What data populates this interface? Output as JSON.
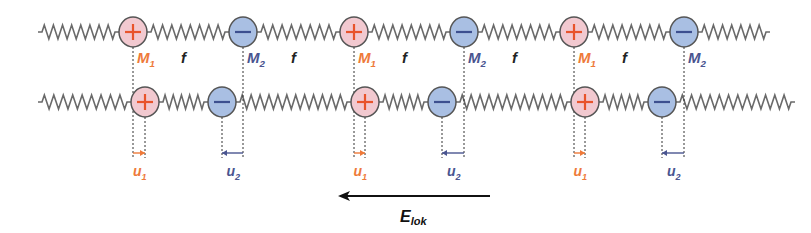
{
  "colors": {
    "positive_fill": "#f2c9d0",
    "negative_fill": "#a9bfe3",
    "positive_sign": "#e8542c",
    "negative_sign": "#3d4f8f",
    "outline": "#555555",
    "spring": "#6a6a6a",
    "label_m1": "#ee7a3a",
    "label_m2": "#4a5590",
    "label_f": "#222222",
    "label_u1": "#ee7a3a",
    "label_u2": "#4a5590",
    "field": "#111111"
  },
  "top_row": {
    "y": 32,
    "ions": [
      {
        "x": 133,
        "charge": "+"
      },
      {
        "x": 243,
        "charge": "-"
      },
      {
        "x": 354,
        "charge": "+"
      },
      {
        "x": 464,
        "charge": "-"
      },
      {
        "x": 574,
        "charge": "+"
      },
      {
        "x": 684,
        "charge": "-"
      }
    ],
    "ends": [
      38,
      770
    ]
  },
  "bottom_row": {
    "y": 102,
    "ions": [
      {
        "x": 145,
        "charge": "+"
      },
      {
        "x": 222,
        "charge": "-"
      },
      {
        "x": 365,
        "charge": "+"
      },
      {
        "x": 442,
        "charge": "-"
      },
      {
        "x": 585,
        "charge": "+"
      },
      {
        "x": 662,
        "charge": "-"
      }
    ],
    "ends": [
      38,
      795
    ]
  },
  "labels": {
    "m1": "M",
    "m1_sub": "1",
    "m2": "M",
    "m2_sub": "2",
    "f": "f",
    "u1": "u",
    "u1_sub": "1",
    "u2": "u",
    "u2_sub": "2",
    "field": "E",
    "field_sub": "lok"
  },
  "field_arrow": {
    "x1": 490,
    "x2": 338,
    "y": 196
  }
}
